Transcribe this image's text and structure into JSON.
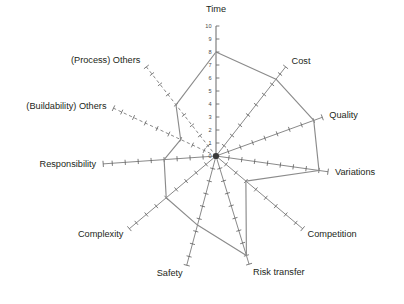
{
  "chart": {
    "title": "",
    "center_label": "Time"
  },
  "chart_data": {
    "type": "radar",
    "title": "",
    "subtitle": "",
    "xlabel": "",
    "ylabel": "",
    "grid": false,
    "legend": "none",
    "radial_axis": {
      "min": 0,
      "max": 10,
      "tick_step": 1,
      "tick_labels": [
        "0",
        "1",
        "2",
        "3",
        "4",
        "5",
        "6",
        "7",
        "8",
        "9",
        "10"
      ],
      "labelled_axis": "Time"
    },
    "categories": [
      "Time",
      "Cost",
      "Quality",
      "Variations",
      "Competition",
      "Risk transfer",
      "Safety",
      "Complexity",
      "Responsibility",
      "(Buildability) Others",
      "(Process) Others"
    ],
    "values": [
      8,
      7.5,
      8,
      8,
      3,
      8,
      5.5,
      5,
      4,
      3,
      5
    ],
    "axis_styles": [
      "solid",
      "solid",
      "solid",
      "solid",
      "solid",
      "solid",
      "solid",
      "solid",
      "solid",
      "dashed",
      "dashed"
    ],
    "axis_angles_deg": [
      270,
      308,
      340,
      8,
      40,
      73,
      105,
      140,
      176,
      205,
      232
    ],
    "series": [
      {
        "name": "Profile",
        "values": [
          8,
          7.5,
          8,
          8,
          3,
          8,
          5.5,
          5,
          4,
          3,
          5
        ]
      }
    ],
    "colors": {
      "series_line": "#8b8b8b",
      "axis_line": "#6b6b6b",
      "text": "#231f20",
      "background": "#ffffff"
    }
  },
  "labels": {
    "time": "Time",
    "cost": "Cost",
    "quality": "Quality",
    "variations": "Variations",
    "competition": "Competition",
    "risk_transfer": "Risk transfer",
    "safety": "Safety",
    "complexity": "Complexity",
    "responsibility": "Responsibility",
    "buildability_others": "(Buildability) Others",
    "process_others": "(Process) Others"
  },
  "ticks": {
    "t10": "10",
    "t9": "9",
    "t8": "8",
    "t7": "7",
    "t6": "6",
    "t5": "5",
    "t4": "4",
    "t3": "3",
    "t2": "2",
    "t1": "1",
    "t0": "0"
  }
}
